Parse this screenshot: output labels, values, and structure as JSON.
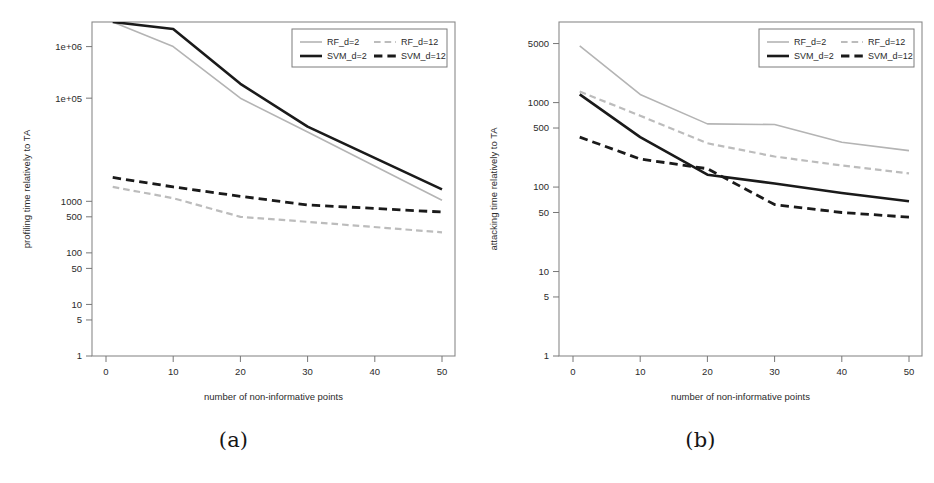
{
  "figure": {
    "panels": [
      {
        "id": "panel-a",
        "caption": "(a)",
        "chart_data": {
          "type": "line",
          "title": "",
          "xlabel": "number of non-informative points",
          "ylabel": "profiling time relatively to TA",
          "xlim": [
            0,
            50
          ],
          "ylim": [
            1,
            3000000
          ],
          "yscale": "log",
          "grid": false,
          "legend_position": "top-right",
          "xticks": [
            0,
            10,
            20,
            30,
            40,
            50
          ],
          "xticklabels": [
            "0",
            "10",
            "20",
            "30",
            "40",
            "50"
          ],
          "yticks": [
            1,
            5,
            10,
            50,
            100,
            500,
            1000,
            100000,
            1000000
          ],
          "yticklabels": [
            "1",
            "5",
            "10",
            "50",
            "100",
            "500",
            "1000",
            "1e+05",
            "1e+06"
          ],
          "x": [
            1,
            10,
            20,
            30,
            50
          ],
          "series": [
            {
              "name": "RF_d=2",
              "color": "#b4b4b4",
              "style": "solid",
              "width": 1.6,
              "values": [
                3000000,
                1000000,
                100000,
                22000,
                1050
              ]
            },
            {
              "name": "SVM_d=2",
              "color": "#1a1a1a",
              "style": "solid",
              "width": 2.6,
              "values": [
                3000000,
                2200000,
                190000,
                28000,
                1700
              ]
            },
            {
              "name": "RF_d=12",
              "color": "#bcbcbc",
              "style": "dashed",
              "width": 2.2,
              "values": [
                1900,
                1150,
                500,
                400,
                250
              ]
            },
            {
              "name": "SVM_d=12",
              "color": "#1a1a1a",
              "style": "dashed",
              "width": 2.8,
              "values": [
                2900,
                1900,
                1250,
                850,
                620
              ]
            }
          ]
        },
        "legend": {
          "entries": [
            {
              "label": "RF_d=2",
              "color": "#b4b4b4",
              "style": "solid",
              "width": 1.6
            },
            {
              "label": "RF_d=12",
              "color": "#bcbcbc",
              "style": "dashed",
              "width": 2.2
            },
            {
              "label": "SVM_d=2",
              "color": "#1a1a1a",
              "style": "solid",
              "width": 2.6
            },
            {
              "label": "SVM_d=12",
              "color": "#1a1a1a",
              "style": "dashed",
              "width": 2.8
            }
          ]
        }
      },
      {
        "id": "panel-b",
        "caption": "(b)",
        "chart_data": {
          "type": "line",
          "title": "",
          "xlabel": "number of non-informative points",
          "ylabel": "attacking time relatively to TA",
          "xlim": [
            0,
            50
          ],
          "ylim": [
            1,
            9000
          ],
          "yscale": "log",
          "grid": false,
          "legend_position": "top-right",
          "xticks": [
            0,
            10,
            20,
            30,
            40,
            50
          ],
          "xticklabels": [
            "0",
            "10",
            "20",
            "30",
            "40",
            "50"
          ],
          "yticks": [
            1,
            5,
            10,
            50,
            100,
            500,
            1000,
            5000
          ],
          "yticklabels": [
            "1",
            "5",
            "10",
            "50",
            "100",
            "500",
            "1000",
            "5000"
          ],
          "x": [
            1,
            10,
            20,
            30,
            40,
            50
          ],
          "series": [
            {
              "name": "RF_d=2",
              "color": "#b4b4b4",
              "style": "solid",
              "width": 1.6,
              "values": [
                4700,
                1250,
                560,
                550,
                340,
                270
              ]
            },
            {
              "name": "SVM_d=2",
              "color": "#1a1a1a",
              "style": "solid",
              "width": 2.6,
              "values": [
                1250,
                390,
                140,
                110,
                85,
                68
              ]
            },
            {
              "name": "RF_d=12",
              "color": "#bcbcbc",
              "style": "dashed",
              "width": 2.2,
              "values": [
                1350,
                700,
                330,
                230,
                180,
                145
              ]
            },
            {
              "name": "SVM_d=12",
              "color": "#1a1a1a",
              "style": "dashed",
              "width": 2.8,
              "values": [
                390,
                215,
                165,
                62,
                50,
                44
              ]
            }
          ]
        },
        "legend": {
          "entries": [
            {
              "label": "RF_d=2",
              "color": "#b4b4b4",
              "style": "solid",
              "width": 1.6
            },
            {
              "label": "RF_d=12",
              "color": "#bcbcbc",
              "style": "dashed",
              "width": 2.2
            },
            {
              "label": "SVM_d=2",
              "color": "#1a1a1a",
              "style": "solid",
              "width": 2.6
            },
            {
              "label": "SVM_d=12",
              "color": "#1a1a1a",
              "style": "dashed",
              "width": 2.8
            }
          ]
        }
      }
    ]
  }
}
